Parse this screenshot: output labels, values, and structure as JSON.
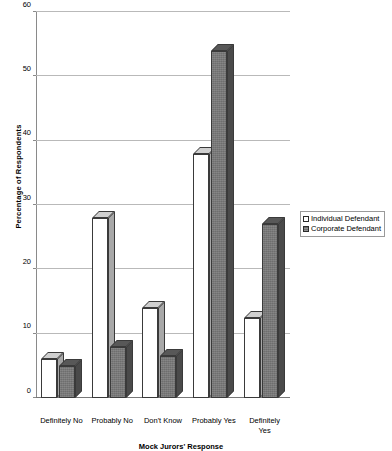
{
  "chart_data": {
    "type": "bar",
    "title": "",
    "xlabel": "Mock Jurors' Response",
    "ylabel": "Percentage of Respondents",
    "ylim": [
      0,
      60
    ],
    "yticks": [
      0,
      10,
      20,
      30,
      40,
      50,
      60
    ],
    "ytick_labels": [
      "0",
      "10",
      "20",
      "30",
      "40",
      "50",
      "60"
    ],
    "grid": true,
    "style": "3d-grouped-bar",
    "legend_position": "right",
    "categories": [
      "Definitely No",
      "Probably No",
      "Don't Know",
      "Probably Yes",
      "Definitely Yes"
    ],
    "category_label_lines": [
      [
        "Definitely No"
      ],
      [
        "Probably No"
      ],
      [
        "Don't Know"
      ],
      [
        "Probably Yes"
      ],
      [
        "Definitely",
        "Yes"
      ]
    ],
    "series": [
      {
        "name": "Individual Defendant",
        "color": "#ffffff",
        "values": [
          6,
          28,
          14,
          38,
          12.5
        ]
      },
      {
        "name": "Corporate Defendant",
        "color": "#6e6e6e",
        "values": [
          5,
          8,
          6.5,
          54,
          27
        ]
      }
    ]
  },
  "legend": {
    "items": [
      {
        "label": "Individual Defendant",
        "swatch": "white-square-icon"
      },
      {
        "label": "Corporate Defendant",
        "swatch": "dark-square-icon"
      }
    ]
  }
}
